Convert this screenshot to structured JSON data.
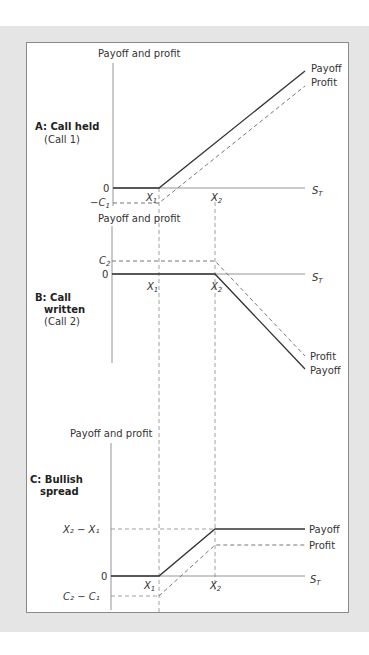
{
  "panels": {
    "a": {
      "title": "A: Call held",
      "subtitle": "(Call 1)",
      "y_axis": "Payoff and profit",
      "zero": "0",
      "neg_label": "−C",
      "neg_sub": "1",
      "x_axis": "S",
      "x_axis_sub": "T",
      "x1": "X",
      "x1_sub": "1",
      "x2": "X",
      "x2_sub": "2",
      "payoff": "Payoff",
      "profit": "Profit"
    },
    "b": {
      "title1": "B: Call",
      "title2": "written",
      "subtitle": "(Call 2)",
      "y_axis": "Payoff and profit",
      "zero": "0",
      "pos_label": "C",
      "pos_sub": "2",
      "x_axis": "S",
      "x_axis_sub": "T",
      "x1": "X",
      "x1_sub": "1",
      "x2": "X",
      "x2_sub": "2",
      "payoff": "Payoff",
      "profit": "Profit"
    },
    "c": {
      "title1": "C: Bullish",
      "title2": "spread",
      "y_axis": "Payoff and profit",
      "zero": "0",
      "top_label": "X₂ − X₁",
      "bottom_label": "C₂ − C₁",
      "x_axis": "S",
      "x_axis_sub": "T",
      "x1": "X",
      "x1_sub": "1",
      "x2": "X",
      "x2_sub": "2",
      "payoff": "Payoff",
      "profit": "Profit"
    }
  },
  "colors": {
    "payoff_line": "#333333",
    "profit_line": "#777777",
    "axis": "#888888",
    "band": "#e5e5e5"
  }
}
